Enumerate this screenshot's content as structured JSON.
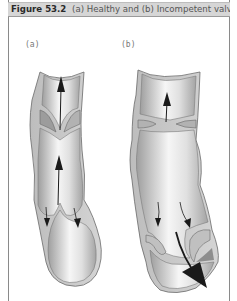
{
  "figure": {
    "label": "Figure 53.2",
    "caption": "(a) Healthy and (b) Incompetent valve."
  },
  "panels": [
    {
      "id": "a",
      "label": "(a)",
      "description": "Healthy valve: valve cusps meet, blood flows upward; back-flow arrows stop at the closed cusps"
    },
    {
      "id": "b",
      "label": "(b)",
      "description": "Incompetent valve: dilated vein, cusps fail to close, large arrow shows blood leaking backward"
    }
  ],
  "colors": {
    "caption_bg": "#d6d6d6",
    "vein_wall": "#c8c8c8",
    "vein_outline": "#6a6a6a",
    "lumen_light": "#f4f4f4",
    "lumen_dark": "#a8a8a8",
    "arrow": "#1a1a1a"
  }
}
